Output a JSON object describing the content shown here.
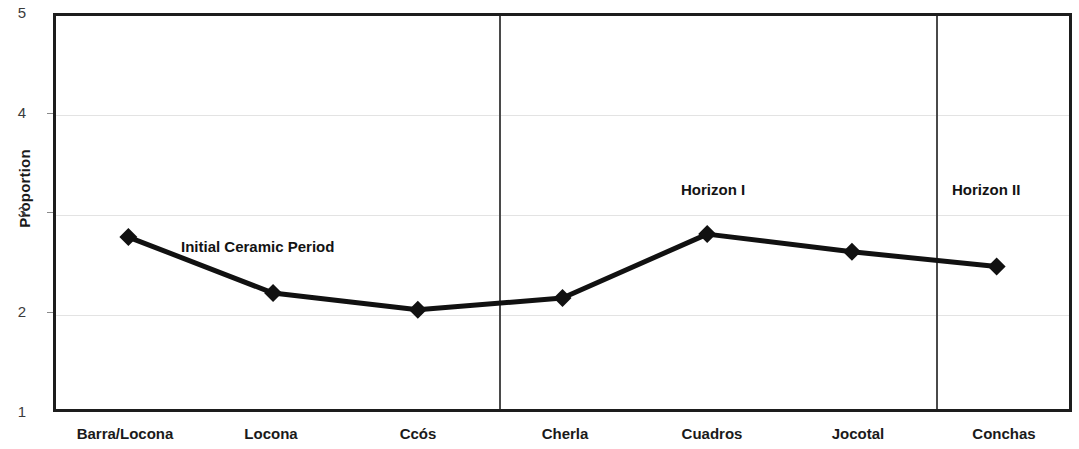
{
  "chart_data": {
    "type": "line",
    "title": "",
    "xlabel": "",
    "ylabel": "Proportion",
    "categories": [
      "Barra/Locona",
      "Locona",
      "Ccós",
      "Cherla",
      "Cuadros",
      "Jocotal",
      "Conchas"
    ],
    "values": [
      2.75,
      2.18,
      2.01,
      2.13,
      2.78,
      2.6,
      2.45
    ],
    "series": [
      {
        "name": "Proportion",
        "values": [
          2.75,
          2.18,
          2.01,
          2.13,
          2.78,
          2.6,
          2.45
        ]
      }
    ],
    "ylim": [
      1,
      5
    ],
    "yticks": [
      1,
      2,
      3,
      4,
      5
    ],
    "ytick_labels": [
      "1",
      "2",
      "3",
      "4",
      "5"
    ],
    "grid": true,
    "grid_axis": "y",
    "legend": "none",
    "marker": "diamond",
    "line_color": "#111111",
    "marker_color": "#111111",
    "annotations": [
      {
        "text": "Initial Ceramic Period",
        "x_fraction": 0.175,
        "y_value": 2.74
      },
      {
        "text": "Horizon I",
        "x_fraction": 0.615,
        "y_value": 3.18
      },
      {
        "text": "Horizon II",
        "x_fraction": 0.885,
        "y_value": 3.18
      }
    ],
    "dividers": [
      {
        "label": "initial-ceramic-to-horizon-i",
        "after_category": "Ccós",
        "x_fraction": 0.4347
      },
      {
        "label": "horizon-i-to-horizon-ii",
        "after_category": "Jocotal",
        "x_fraction": 0.8636
      }
    ]
  },
  "axes": {
    "y_title": "Proportion",
    "y_tick_labels": [
      "5",
      "4",
      "3",
      "2",
      "1"
    ],
    "x_tick_labels": [
      "Barra/Locona",
      "Locona",
      "Ccós",
      "Cherla",
      "Cuadros",
      "Jocotal",
      "Conchas"
    ]
  },
  "annotations": {
    "initial_ceramic_period": "Initial Ceramic Period",
    "horizon_i": "Horizon I",
    "horizon_ii": "Horizon II"
  },
  "colors": {
    "line": "#111111",
    "marker": "#111111",
    "axis_border": "#1d1d1d",
    "gridline": "#e3e3e3",
    "divider": "#4a4a4a",
    "text": "#1a1a1a",
    "background": "#ffffff"
  }
}
